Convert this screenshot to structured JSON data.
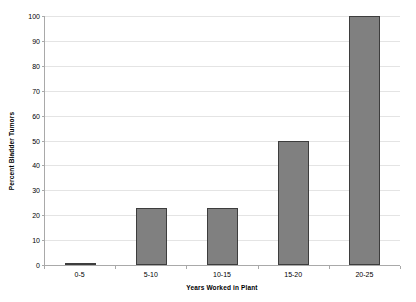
{
  "chart_data": {
    "type": "bar",
    "title": "",
    "categories": [
      "0-5",
      "5-10",
      "10-15",
      "15-20",
      "20-25"
    ],
    "values": [
      1,
      23,
      23,
      50,
      100
    ],
    "xlabel": "Years Worked in Plant",
    "ylabel": "Percent Bladder Tumors",
    "ylim": [
      0,
      100
    ],
    "yticks": [
      0,
      10,
      20,
      30,
      40,
      50,
      60,
      70,
      80,
      90,
      100
    ],
    "ytick_labels": [
      "0",
      "10",
      "20",
      "30",
      "40",
      "50",
      "60",
      "70",
      "80",
      "90",
      "100"
    ],
    "grid": true,
    "grid_axis": "y",
    "legend": false,
    "legend_position": "none",
    "bar_color": "#808080",
    "bar_border_color": "#3d3d3d",
    "gridline_color": "#e4e4e4",
    "axis_color": "#a9a9a9",
    "background_color": "#ffffff"
  }
}
